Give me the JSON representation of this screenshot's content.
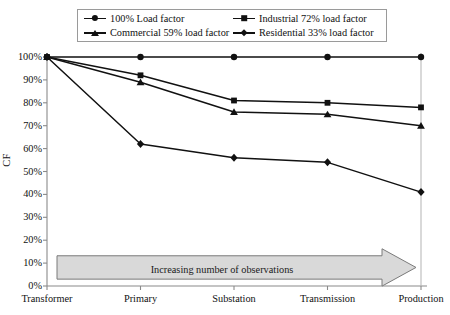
{
  "chart_data": {
    "type": "line",
    "title": "",
    "xlabel": "",
    "ylabel": "CF",
    "categories": [
      "Transformer",
      "Primary",
      "Substation",
      "Transmission",
      "Production"
    ],
    "ylim": [
      0,
      100
    ],
    "ytick_labels": [
      "0%",
      "10%",
      "20%",
      "30%",
      "40%",
      "50%",
      "60%",
      "70%",
      "80%",
      "90%",
      "100%"
    ],
    "ytick_values": [
      0,
      10,
      20,
      30,
      40,
      50,
      60,
      70,
      80,
      90,
      100
    ],
    "grid": false,
    "legend_position": "top-center",
    "series": [
      {
        "name": "100% Load factor",
        "marker": "circle",
        "values": [
          100,
          100,
          100,
          100,
          100
        ]
      },
      {
        "name": "Industrial 72% load factor",
        "marker": "square",
        "values": [
          100,
          92,
          81,
          80,
          78
        ]
      },
      {
        "name": "Commercial 59% load factor",
        "marker": "triangle",
        "values": [
          100,
          89,
          76,
          75,
          70
        ]
      },
      {
        "name": "Residential 33% load factor",
        "marker": "diamond",
        "values": [
          100,
          62,
          56,
          54,
          41
        ]
      }
    ],
    "annotations": [
      {
        "id": "observations-arrow",
        "text": "Increasing number of observations",
        "shape": "right-arrow",
        "y_value": 8
      }
    ],
    "colors": {
      "line": "#111111",
      "marker": "#111111",
      "axis": "#8a8a8a",
      "banner_fill": "#d9d9d9",
      "banner_stroke": "#7a7a7a"
    }
  }
}
